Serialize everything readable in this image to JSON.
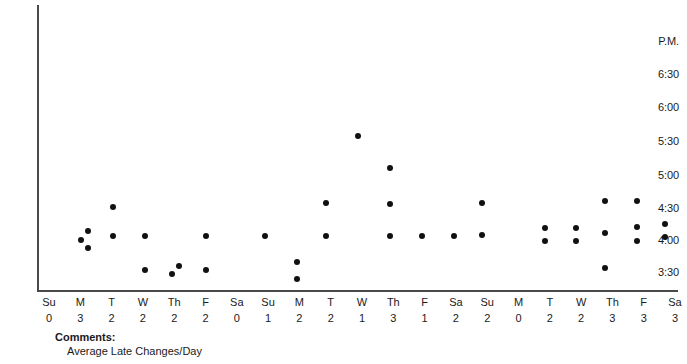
{
  "chart_data": {
    "type": "scatter",
    "title": "",
    "xlabel": "",
    "ylabel": "P.M.",
    "grid": false,
    "legend": null,
    "ylim": [
      "3:15",
      "7:00"
    ],
    "y_axis": {
      "header_label": "P.M.",
      "tick_labels": [
        "6:30",
        "6:00",
        "5:30",
        "5:00",
        "4:30",
        "4:00",
        "3:30"
      ],
      "tick_values_minutes": [
        1110,
        1080,
        1050,
        1020,
        990,
        960,
        930
      ]
    },
    "x_axis": {
      "day_labels": [
        "Su",
        "M",
        "T",
        "W",
        "Th",
        "F",
        "Sa",
        "Su",
        "M",
        "T",
        "W",
        "Th",
        "F",
        "Sa",
        "Su",
        "M",
        "T",
        "W",
        "Th",
        "F",
        "Sa"
      ],
      "count_labels": [
        "0",
        "3",
        "2",
        "2",
        "2",
        "2",
        "0",
        "1",
        "2",
        "2",
        "1",
        "3",
        "1",
        "2",
        "2",
        "0",
        "2",
        "2",
        "3",
        "3",
        "3"
      ]
    },
    "columns": [
      {
        "day": "Su",
        "count": "0",
        "points": []
      },
      {
        "day": "M",
        "count": "3",
        "points": [
          "4:00",
          "4:06",
          "3:54"
        ]
      },
      {
        "day": "T",
        "count": "2",
        "points": [
          "4:30",
          "4:02"
        ]
      },
      {
        "day": "W",
        "count": "2",
        "points": [
          "4:02",
          "3:30"
        ]
      },
      {
        "day": "Th",
        "count": "2",
        "points": [
          "3:33",
          "3:40"
        ]
      },
      {
        "day": "F",
        "count": "2",
        "points": [
          "4:02",
          "3:30"
        ]
      },
      {
        "day": "Sa",
        "count": "0",
        "points": []
      },
      {
        "day": "Su",
        "count": "1",
        "points": [
          "4:03"
        ]
      },
      {
        "day": "M",
        "count": "2",
        "points": [
          "3:40",
          "3:24"
        ]
      },
      {
        "day": "T",
        "count": "2",
        "points": [
          "4:33",
          "4:03"
        ]
      },
      {
        "day": "W",
        "count": "1",
        "points": [
          "5:37"
        ]
      },
      {
        "day": "Th",
        "count": "3",
        "points": [
          "5:05",
          "4:34",
          "4:02"
        ]
      },
      {
        "day": "F",
        "count": "1",
        "points": [
          "4:02"
        ]
      },
      {
        "day": "Sa",
        "count": "2",
        "points": [
          "4:02"
        ]
      },
      {
        "day": "Su",
        "count": "2",
        "points": [
          "4:35",
          "4:04"
        ]
      },
      {
        "day": "M",
        "count": "0",
        "points": []
      },
      {
        "day": "T",
        "count": "2",
        "points": [
          "4:14",
          "3:58"
        ]
      },
      {
        "day": "W",
        "count": "2",
        "points": [
          "4:14",
          "3:58"
        ]
      },
      {
        "day": "Th",
        "count": "3",
        "points": [
          "4:35",
          "4:01",
          "3:28"
        ]
      },
      {
        "day": "F",
        "count": "3",
        "points": [
          "4:35",
          "4:09",
          "3:58"
        ]
      },
      {
        "day": "Sa",
        "count": "3",
        "points": [
          "4:11",
          "3:59"
        ]
      }
    ],
    "points_px": [
      {
        "x": 81,
        "y": 240
      },
      {
        "x": 88,
        "y": 231
      },
      {
        "x": 88,
        "y": 248
      },
      {
        "x": 113,
        "y": 207
      },
      {
        "x": 113,
        "y": 236
      },
      {
        "x": 145,
        "y": 236
      },
      {
        "x": 145,
        "y": 270
      },
      {
        "x": 172,
        "y": 274
      },
      {
        "x": 179,
        "y": 266
      },
      {
        "x": 206,
        "y": 236
      },
      {
        "x": 206,
        "y": 270
      },
      {
        "x": 265,
        "y": 236
      },
      {
        "x": 297,
        "y": 262
      },
      {
        "x": 297,
        "y": 279
      },
      {
        "x": 326,
        "y": 203
      },
      {
        "x": 326,
        "y": 236
      },
      {
        "x": 358,
        "y": 136
      },
      {
        "x": 390,
        "y": 168
      },
      {
        "x": 390,
        "y": 204
      },
      {
        "x": 390,
        "y": 236
      },
      {
        "x": 422,
        "y": 236
      },
      {
        "x": 454,
        "y": 236
      },
      {
        "x": 482,
        "y": 203
      },
      {
        "x": 482,
        "y": 235
      },
      {
        "x": 545,
        "y": 228
      },
      {
        "x": 545,
        "y": 241
      },
      {
        "x": 576,
        "y": 228
      },
      {
        "x": 576,
        "y": 241
      },
      {
        "x": 605,
        "y": 201
      },
      {
        "x": 605,
        "y": 233
      },
      {
        "x": 605,
        "y": 268
      },
      {
        "x": 637,
        "y": 201
      },
      {
        "x": 637,
        "y": 227
      },
      {
        "x": 637,
        "y": 241
      },
      {
        "x": 665,
        "y": 224
      },
      {
        "x": 665,
        "y": 237
      }
    ]
  },
  "comments": {
    "label": "Comments:",
    "text": "Average Late Changes/Day"
  },
  "colors": {
    "dot": "#111111",
    "axis": "#4a4a4a",
    "text": "#1a1a1a",
    "background": "#ffffff"
  }
}
